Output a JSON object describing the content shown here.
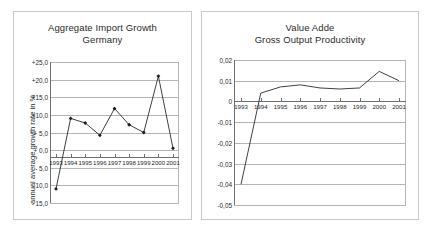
{
  "charts": {
    "left": {
      "title_line1": "Aggregate Import Growth",
      "title_line2": "Germany",
      "ylabel": "annual average growth rate in %",
      "ytick_labels": [
        "+25,0",
        "+20,0",
        "+15,0",
        "+10,0",
        "+ 5,0",
        "+ 0,0",
        "- 5,0",
        "- 10,0",
        "- 15,0"
      ],
      "xtick_labels": [
        "1993",
        "1994",
        "1995",
        "1996",
        "1997",
        "1998",
        "1999",
        "2000",
        "2001"
      ]
    },
    "right": {
      "title_line1": "Value Adde",
      "title_line2": "Gross Output Productivity",
      "ytick_labels": [
        "0,02",
        "0,01",
        "0",
        "-0,01",
        "-0,02",
        "-0,03",
        "-0,04",
        "-0,05"
      ],
      "xtick_labels": [
        "1993",
        "1994",
        "1995",
        "1996",
        "1997",
        "1998",
        "1999",
        "2000",
        "2001"
      ]
    }
  },
  "chart_data": [
    {
      "type": "line",
      "title": "Aggregate Import Growth Germany",
      "xlabel": "",
      "ylabel": "annual average growth rate in %",
      "categories": [
        "1993",
        "1994",
        "1995",
        "1996",
        "1997",
        "1998",
        "1999",
        "2000",
        "2001"
      ],
      "values": [
        -11.0,
        9.0,
        7.7,
        4.2,
        11.8,
        7.2,
        5.0,
        21.0,
        0.5
      ],
      "ylim": [
        -15.0,
        25.0
      ],
      "ytick_values": [
        25.0,
        20.0,
        15.0,
        10.0,
        5.0,
        0.0,
        -5.0,
        -10.0,
        -15.0
      ],
      "grid": true,
      "markers": "diamond",
      "legend": "none",
      "line_color": "#2a2a2a"
    },
    {
      "type": "line",
      "title": "Value Adde Gross Output Productivity",
      "xlabel": "",
      "ylabel": "",
      "categories": [
        "1993",
        "1994",
        "1995",
        "1996",
        "1997",
        "1998",
        "1999",
        "2000",
        "2001"
      ],
      "values": [
        -0.04,
        0.004,
        0.007,
        0.008,
        0.0065,
        0.006,
        0.0065,
        0.0145,
        0.01
      ],
      "ylim": [
        -0.05,
        0.02
      ],
      "ytick_values": [
        0.02,
        0.01,
        0.0,
        -0.01,
        -0.02,
        -0.03,
        -0.04,
        -0.05
      ],
      "grid": true,
      "markers": "none",
      "legend": "none",
      "line_color": "#2a2a2a"
    }
  ]
}
